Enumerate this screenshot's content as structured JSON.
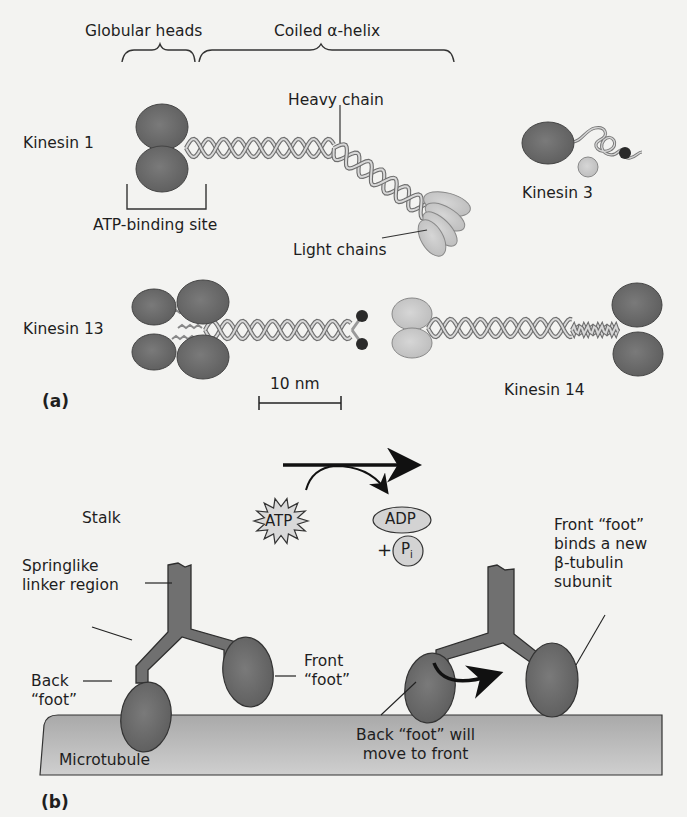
{
  "figure": {
    "panel_a": {
      "label": "(a)",
      "brackets": {
        "globular_heads": "Globular heads",
        "coiled_helix": "Coiled α-helix",
        "atp_binding_site": "ATP-binding site"
      },
      "proteins": {
        "kinesin1": "Kinesin 1",
        "kinesin3": "Kinesin 3",
        "kinesin13": "Kinesin 13",
        "kinesin14": "Kinesin 14"
      },
      "callouts": {
        "heavy_chain": "Heavy chain",
        "light_chains": "Light chains"
      },
      "scale_bar": "10 nm"
    },
    "panel_b": {
      "label": "(b)",
      "stalk": "Stalk",
      "springlike": "Springlike\nlinker region",
      "back_foot": "Back\n“foot”",
      "front_foot": "Front\n“foot”",
      "front_binds": "Front “foot”\nbinds a new\nβ-tubulin\nsubunit",
      "back_will_move": "Back “foot” will\nmove to front",
      "microtubule": "Microtubule",
      "atp": "ATP",
      "adp": "ADP",
      "plus": "+",
      "pi_main": "P",
      "pi_sub": "i"
    },
    "colors": {
      "head_dark": "#6c6c6c",
      "head_light": "#c9c9c9",
      "helix": "#b5b5b5",
      "microtubule": "#b9b9b9",
      "ink": "#1e1e1e"
    }
  }
}
